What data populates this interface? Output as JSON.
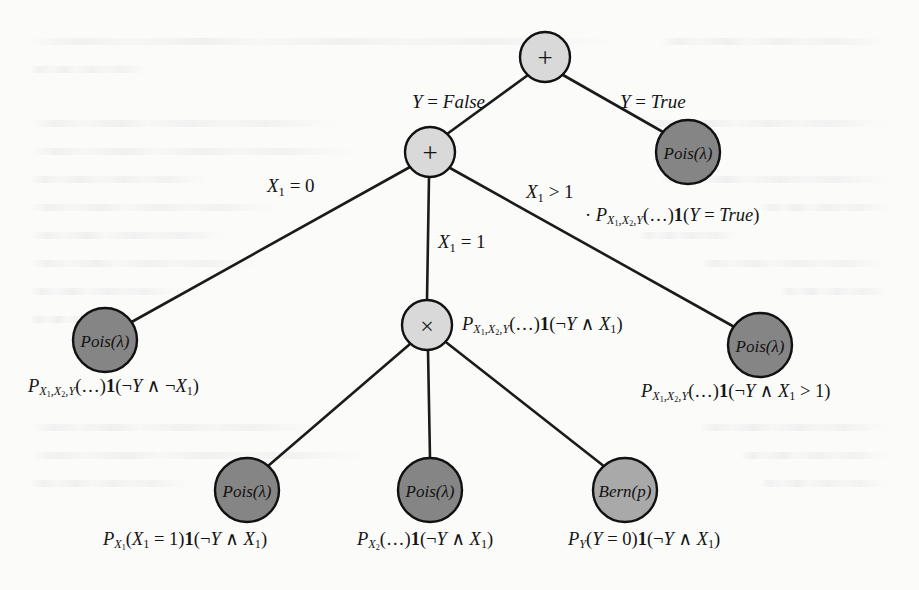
{
  "figure": {
    "type": "probability-circuit-tree",
    "background_color": "#fbfbfa",
    "ink_color": "#141414",
    "colors": {
      "internal_node_fill": "#d9d9d9",
      "leaf_dark_fill": "#858585",
      "leaf_light_fill": "#a9a9a9",
      "node_stroke": "#111111",
      "edge_stroke": "#1b1b1b"
    }
  },
  "nodes": {
    "root": {
      "id": "n-root",
      "label": "+",
      "kind": "sum",
      "x": 545,
      "y": 57,
      "r": 25,
      "fill": "#d9d9d9"
    },
    "sum_inner": {
      "id": "n-sum-inner",
      "label": "+",
      "kind": "sum",
      "x": 430,
      "y": 152,
      "r": 25,
      "fill": "#d9d9d9"
    },
    "prod": {
      "id": "n-prod",
      "label": "×",
      "kind": "product",
      "x": 427,
      "y": 325,
      "r": 25,
      "fill": "#d9d9d9"
    },
    "leaf_true": {
      "id": "n-leaf-true",
      "label": "Pois(λ)",
      "kind": "leaf",
      "x": 688,
      "y": 152,
      "r": 32,
      "fill": "#858585"
    },
    "leaf_x1_eq0": {
      "id": "n-leaf-x1-eq0",
      "label": "Pois(λ)",
      "kind": "leaf",
      "x": 105,
      "y": 340,
      "r": 32,
      "fill": "#858585"
    },
    "leaf_x1_gt1": {
      "id": "n-leaf-x1-gt1",
      "label": "Pois(λ)",
      "kind": "leaf",
      "x": 760,
      "y": 345,
      "r": 32,
      "fill": "#858585"
    },
    "leaf_px1": {
      "id": "n-leaf-px1",
      "label": "Pois(λ)",
      "kind": "leaf",
      "x": 247,
      "y": 490,
      "r": 32,
      "fill": "#858585"
    },
    "leaf_px2": {
      "id": "n-leaf-px2",
      "label": "Pois(λ)",
      "kind": "leaf",
      "x": 430,
      "y": 490,
      "r": 32,
      "fill": "#858585"
    },
    "leaf_py": {
      "id": "n-leaf-py",
      "label": "Bern(p)",
      "kind": "leaf",
      "x": 625,
      "y": 490,
      "r": 32,
      "fill": "#a9a9a9"
    }
  },
  "edges": [
    {
      "from": "root",
      "to": "sum_inner",
      "label": "Y = False"
    },
    {
      "from": "root",
      "to": "leaf_true",
      "label": "Y = True"
    },
    {
      "from": "sum_inner",
      "to": "leaf_x1_eq0",
      "label": "X₁ = 0"
    },
    {
      "from": "sum_inner",
      "to": "prod",
      "label": "X₁ = 1"
    },
    {
      "from": "sum_inner",
      "to": "leaf_x1_gt1",
      "label": "X₁ > 1"
    },
    {
      "from": "prod",
      "to": "leaf_px1",
      "label": ""
    },
    {
      "from": "prod",
      "to": "leaf_px2",
      "label": ""
    },
    {
      "from": "prod",
      "to": "leaf_py",
      "label": ""
    }
  ],
  "edge_labels": {
    "y_false": {
      "text": "Y = False",
      "x": 412,
      "y": 100
    },
    "y_true": {
      "text": "Y = True",
      "x": 620,
      "y": 100
    },
    "x1_eq_0": {
      "text": "X₁ = 0",
      "x": 267,
      "y": 184
    },
    "x1_eq_1": {
      "text": "X₁ = 1",
      "x": 438,
      "y": 240
    },
    "x1_gt_1": {
      "text": "X₁ > 1",
      "x": 526,
      "y": 190
    }
  },
  "captions": {
    "leaf_true": {
      "text": "P_{X₁,X₂,Y}(...)¹(Y = True)",
      "x": 585,
      "y": 215
    },
    "prod": {
      "text": "P_{X₁,X₂,Y}(...)¹(¬Y ∧ X₁)",
      "x": 462,
      "y": 315
    },
    "leaf_x1_eq0": {
      "text": "P_{X₁,X₂,Y}(...)¹(¬Y ∧ ¬X₁)",
      "x": 28,
      "y": 385
    },
    "leaf_x1_gt1": {
      "text": "P_{X₁,X₂,Y}(...)¹(¬Y ∧ X₁ > 1)",
      "x": 641,
      "y": 390
    },
    "leaf_px1": {
      "text": "P_{X₁}(X₁ = 1)¹(¬Y ∧ X₁)",
      "x": 103,
      "y": 538
    },
    "leaf_px2": {
      "text": "P_{X₂}(...)¹(¬Y ∧ X₁)",
      "x": 357,
      "y": 538
    },
    "leaf_py": {
      "text": "P_{Y}(Y = 0)¹(¬Y ∧ X₁)",
      "x": 568,
      "y": 538
    }
  },
  "caption_parts": {
    "P": "P",
    "sub_x1x2y": "X₁,X₂,Y",
    "sub_x1": "X₁",
    "sub_x2": "X₂",
    "sub_y": "Y",
    "dots": "(…)",
    "one": "1",
    "true_cond": "(Y = True)",
    "neg_and_x1": "(¬Y ∧ X₁)",
    "neg_and_negx1": "(¬Y ∧ ¬X₁)",
    "neg_and_x1gt1": "(¬Y ∧ X₁ > 1)",
    "x1_eq_1_arg": "(X₁ = 1)",
    "y_eq_0_arg": "(Y = 0)",
    "lead_dot": "·"
  }
}
